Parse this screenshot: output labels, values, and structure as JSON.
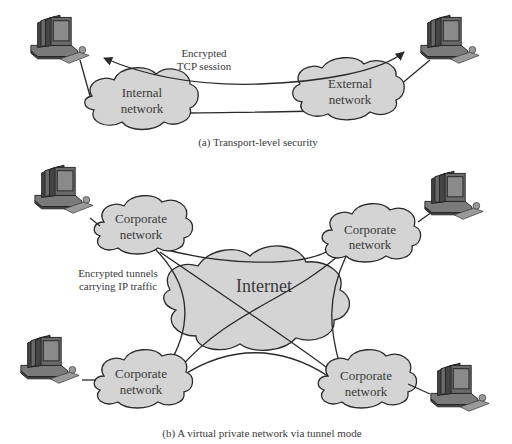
{
  "panel_a": {
    "caption": "(a) Transport-level security",
    "session_label_line1": "Encrypted",
    "session_label_line2": "TCP session",
    "internal_cloud": {
      "line1": "Internal",
      "line2": "network"
    },
    "external_cloud": {
      "line1": "External",
      "line2": "network"
    },
    "hosts": [
      "internal-host",
      "external-host"
    ]
  },
  "panel_b": {
    "caption": "(b) A virtual private network via tunnel mode",
    "tunnel_label_line1": "Encrypted tunnels",
    "tunnel_label_line2": "carrying IP traffic",
    "internet_cloud": {
      "label": "Internet"
    },
    "corporate_clouds": [
      {
        "position": "top-left",
        "line1": "Corporate",
        "line2": "network"
      },
      {
        "position": "top-right",
        "line1": "Corporate",
        "line2": "network"
      },
      {
        "position": "bottom-left",
        "line1": "Corporate",
        "line2": "network"
      },
      {
        "position": "bottom-right",
        "line1": "Corporate",
        "line2": "network"
      }
    ],
    "hosts": [
      "top-left-host",
      "top-right-host",
      "bottom-left-host",
      "bottom-right-host"
    ]
  },
  "colors": {
    "cloud_fill": "#d4d4d4",
    "line": "#2a2a2a",
    "text": "#3a3a3a",
    "background": "#ffffff"
  }
}
